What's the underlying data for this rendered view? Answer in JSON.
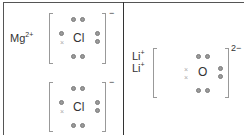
{
  "diagram": {
    "left_panel": {
      "cation": {
        "symbol": "Mg",
        "charge": "2+"
      },
      "anions": [
        {
          "symbol": "Cl",
          "charge": "−",
          "dots": 7,
          "crosses": 1
        },
        {
          "symbol": "Cl",
          "charge": "−",
          "dots": 7,
          "crosses": 1
        }
      ]
    },
    "right_panel": {
      "cations": [
        {
          "symbol": "Li",
          "charge": "+"
        },
        {
          "symbol": "Li",
          "charge": "+"
        }
      ],
      "anion": {
        "symbol": "O",
        "charge": "2−",
        "dots": 6,
        "crosses": 2
      }
    },
    "colors": {
      "dot": "#9a9a9a",
      "cross": "#aaaaaa",
      "border": "#555555"
    }
  }
}
